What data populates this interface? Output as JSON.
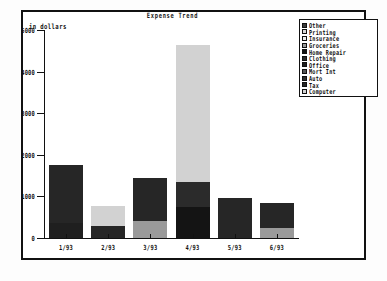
{
  "chart_data": {
    "type": "bar",
    "subtype": "stacked",
    "title": "Expense Trend",
    "xlabel": "",
    "ylabel": "in dollars",
    "categories": [
      "1/93",
      "2/93",
      "3/93",
      "4/93",
      "5/93",
      "6/93"
    ],
    "ylim": [
      0,
      5000
    ],
    "ytick_labels": [
      "5000",
      "4000",
      "3000",
      "2000",
      "1000",
      "0"
    ],
    "ytick_values": [
      5000,
      4000,
      3000,
      2000,
      1000,
      0
    ],
    "grid": false,
    "legend_position": "top-right",
    "series": [
      {
        "name": "Other",
        "color": "#3a3a3a",
        "values": [
          0,
          0,
          0,
          0,
          0,
          0
        ]
      },
      {
        "name": "Printing",
        "color": "#d8d8d8",
        "values": [
          0,
          0,
          0,
          0,
          0,
          0
        ]
      },
      {
        "name": "Insurance",
        "color": "#ededed",
        "values": [
          0,
          0,
          0,
          0,
          0,
          0
        ]
      },
      {
        "name": "Groceries",
        "color": "#9a9a9a",
        "values": [
          0,
          0,
          420,
          0,
          0,
          230
        ]
      },
      {
        "name": "Home Repair",
        "color": "#141414",
        "values": [
          0,
          0,
          0,
          750,
          0,
          0
        ]
      },
      {
        "name": "Clothing",
        "color": "#2b2b2b",
        "values": [
          0,
          0,
          0,
          600,
          0,
          0
        ]
      },
      {
        "name": "Office",
        "color": "#1f1f1f",
        "values": [
          350,
          0,
          0,
          0,
          0,
          0
        ]
      },
      {
        "name": "Mort Int",
        "color": "#555555",
        "values": [
          0,
          0,
          0,
          0,
          0,
          0
        ]
      },
      {
        "name": "Auto",
        "color": "#2e2e2e",
        "values": [
          0,
          0,
          0,
          0,
          0,
          0
        ]
      },
      {
        "name": "Tax",
        "color": "#262626",
        "values": [
          1400,
          300,
          1020,
          0,
          950,
          600
        ]
      },
      {
        "name": "Computer",
        "color": "#d2d2d2",
        "values": [
          0,
          470,
          0,
          3300,
          0,
          0
        ]
      }
    ],
    "totals": [
      1750,
      770,
      1440,
      4650,
      950,
      830
    ]
  },
  "legend": {
    "items": [
      {
        "label": "Other"
      },
      {
        "label": "Printing"
      },
      {
        "label": "Insurance"
      },
      {
        "label": "Groceries"
      },
      {
        "label": "Home Repair"
      },
      {
        "label": "Clothing"
      },
      {
        "label": "Office"
      },
      {
        "label": "Mort Int"
      },
      {
        "label": "Auto"
      },
      {
        "label": "Tax"
      },
      {
        "label": "Computer"
      }
    ]
  }
}
